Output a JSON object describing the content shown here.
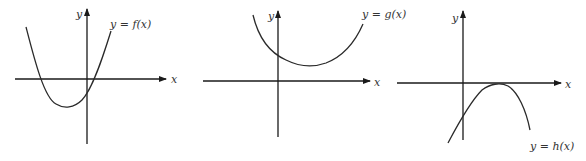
{
  "graphs": [
    {
      "id": "f",
      "equation_label": "y = f(x)",
      "x_axis_label": "x",
      "y_axis_label": "y",
      "description": "Upward-opening parabola, vertex below x-axis left of origin, two real roots (one negative, one small positive), negative y-intercept"
    },
    {
      "id": "g",
      "equation_label": "y = g(x)",
      "x_axis_label": "x",
      "y_axis_label": "y",
      "description": "Upward-opening parabola, vertex above x-axis right of origin, no real roots, positive y-intercept"
    },
    {
      "id": "h",
      "equation_label": "y = h(x)",
      "x_axis_label": "x",
      "y_axis_label": "y",
      "description": "Downward-opening parabola, vertex touching x-axis right of origin (one repeated root), negative y-intercept"
    }
  ],
  "colors": {
    "ink": "#2a2a2a",
    "background": "#ffffff"
  }
}
